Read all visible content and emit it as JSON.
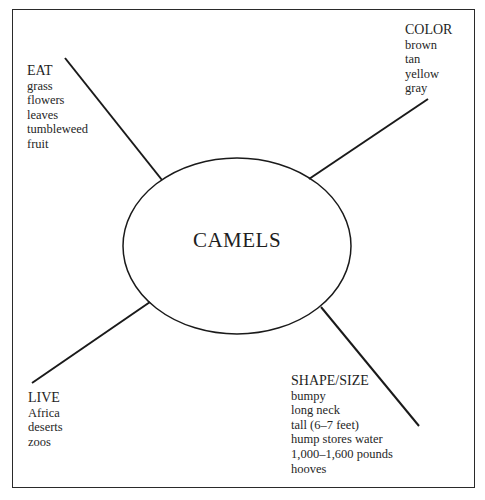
{
  "diagram": {
    "center": {
      "label": "CAMELS"
    },
    "branches": [
      {
        "id": "eat",
        "heading": "EAT",
        "items": [
          "grass",
          "flowers",
          "leaves",
          "tumbleweed",
          "fruit"
        ]
      },
      {
        "id": "color",
        "heading": "COLOR",
        "items": [
          "brown",
          "tan",
          "yellow",
          "gray"
        ]
      },
      {
        "id": "live",
        "heading": "LIVE",
        "items": [
          "Africa",
          "deserts",
          "zoos"
        ]
      },
      {
        "id": "shape",
        "heading": "SHAPE/SIZE",
        "items": [
          "bumpy",
          "long neck",
          "tall (6–7 feet)",
          "hump stores water",
          "1,000–1,600 pounds",
          "hooves"
        ]
      }
    ],
    "colors": {
      "line": "#1a1a1a",
      "border": "#2a2a2a",
      "text": "#222222",
      "background": "#ffffff"
    }
  }
}
